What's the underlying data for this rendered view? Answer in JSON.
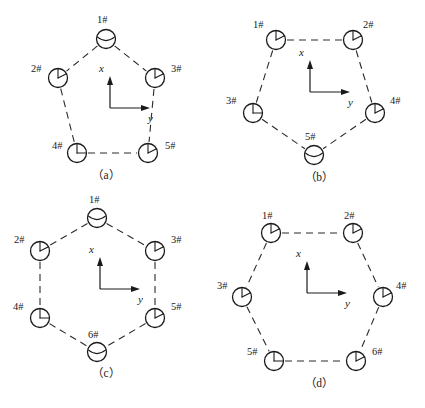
{
  "figure": {
    "type": "technical-diagram",
    "background_color": "#ffffff",
    "line_color": "#2b2b2b",
    "node_glyph": "circle-with-clock-hand"
  },
  "axes": {
    "x_label": "x",
    "y_label": "y",
    "x_direction": "up",
    "y_direction": "right"
  },
  "panels": [
    {
      "id": "a",
      "caption": "（a）",
      "shape": "pentagon",
      "orientation": "vertex-top",
      "node_count": 5,
      "nodes": [
        {
          "label": "1#",
          "cx": 106,
          "cy": 39,
          "label_x": 97,
          "label_y": 14,
          "hand_angle": 200
        },
        {
          "label": "2#",
          "cx": 58,
          "cy": 78,
          "label_x": 31,
          "label_y": 63,
          "hand_angle": 35
        },
        {
          "label": "3#",
          "cx": 155,
          "cy": 78,
          "label_x": 171,
          "label_y": 63,
          "hand_angle": 35
        },
        {
          "label": "4#",
          "cx": 77,
          "cy": 153,
          "label_x": 52,
          "label_y": 140,
          "hand_angle": 0
        },
        {
          "label": "5#",
          "cx": 148,
          "cy": 153,
          "label_x": 165,
          "label_y": 140,
          "hand_angle": 35
        }
      ],
      "edges": [
        [
          0,
          1
        ],
        [
          0,
          2
        ],
        [
          1,
          3
        ],
        [
          2,
          4
        ],
        [
          3,
          4
        ]
      ],
      "axis_origin": {
        "x": 110,
        "y": 108
      },
      "caption_y": 166
    },
    {
      "id": "b",
      "caption": "（b）",
      "shape": "pentagon",
      "orientation": "edge-top",
      "node_count": 5,
      "nodes": [
        {
          "label": "1#",
          "cx": 63,
          "cy": 40,
          "label_x": 40,
          "label_y": 19,
          "hand_angle": 35
        },
        {
          "label": "2#",
          "cx": 140,
          "cy": 40,
          "label_x": 150,
          "label_y": 19,
          "hand_angle": 35
        },
        {
          "label": "3#",
          "cx": 40,
          "cy": 113,
          "label_x": 13,
          "label_y": 95,
          "hand_angle": 0
        },
        {
          "label": "4#",
          "cx": 162,
          "cy": 113,
          "label_x": 177,
          "label_y": 95,
          "hand_angle": 35
        },
        {
          "label": "5#",
          "cx": 101,
          "cy": 155,
          "label_x": 92,
          "label_y": 131,
          "hand_angle": 200
        }
      ],
      "edges": [
        [
          0,
          1
        ],
        [
          0,
          2
        ],
        [
          1,
          3
        ],
        [
          2,
          4
        ],
        [
          3,
          4
        ]
      ],
      "axis_origin": {
        "x": 97,
        "y": 92
      },
      "caption_y": 168
    },
    {
      "id": "c",
      "caption": "（c）",
      "shape": "hexagon",
      "orientation": "vertex-top",
      "node_count": 6,
      "nodes": [
        {
          "label": "1#",
          "cx": 97,
          "cy": 14,
          "label_x": 89,
          "label_y": -10,
          "hand_angle": 200
        },
        {
          "label": "2#",
          "cx": 40,
          "cy": 47,
          "label_x": 14,
          "label_y": 30,
          "hand_angle": 35
        },
        {
          "label": "3#",
          "cx": 155,
          "cy": 47,
          "label_x": 171,
          "label_y": 30,
          "hand_angle": 35
        },
        {
          "label": "4#",
          "cx": 40,
          "cy": 114,
          "label_x": 13,
          "label_y": 97,
          "hand_angle": 0
        },
        {
          "label": "5#",
          "cx": 155,
          "cy": 114,
          "label_x": 171,
          "label_y": 97,
          "hand_angle": 35
        },
        {
          "label": "6#",
          "cx": 97,
          "cy": 148,
          "label_x": 88,
          "label_y": 125,
          "hand_angle": 200
        }
      ],
      "edges": [
        [
          0,
          1
        ],
        [
          0,
          2
        ],
        [
          1,
          3
        ],
        [
          2,
          4
        ],
        [
          3,
          5
        ],
        [
          4,
          5
        ]
      ],
      "axis_origin": {
        "x": 100,
        "y": 85
      },
      "caption_y": 160
    },
    {
      "id": "d",
      "caption": "（d）",
      "shape": "hexagon",
      "orientation": "edge-top",
      "node_count": 6,
      "nodes": [
        {
          "label": "1#",
          "cx": 58,
          "cy": 29,
          "label_x": 49,
          "label_y": 6,
          "hand_angle": 35
        },
        {
          "label": "2#",
          "cx": 140,
          "cy": 29,
          "label_x": 131,
          "label_y": 6,
          "hand_angle": 35
        },
        {
          "label": "3#",
          "cx": 29,
          "cy": 93,
          "label_x": 4,
          "label_y": 76,
          "hand_angle": 35
        },
        {
          "label": "4#",
          "cx": 170,
          "cy": 93,
          "label_x": 183,
          "label_y": 76,
          "hand_angle": 35
        },
        {
          "label": "5#",
          "cx": 61,
          "cy": 157,
          "label_x": 34,
          "label_y": 142,
          "hand_angle": 0
        },
        {
          "label": "6#",
          "cx": 143,
          "cy": 157,
          "label_x": 159,
          "label_y": 142,
          "hand_angle": 35
        }
      ],
      "edges": [
        [
          0,
          1
        ],
        [
          0,
          2
        ],
        [
          1,
          3
        ],
        [
          2,
          4
        ],
        [
          3,
          5
        ],
        [
          4,
          5
        ]
      ],
      "axis_origin": {
        "x": 94,
        "y": 89
      },
      "caption_y": 170
    }
  ]
}
